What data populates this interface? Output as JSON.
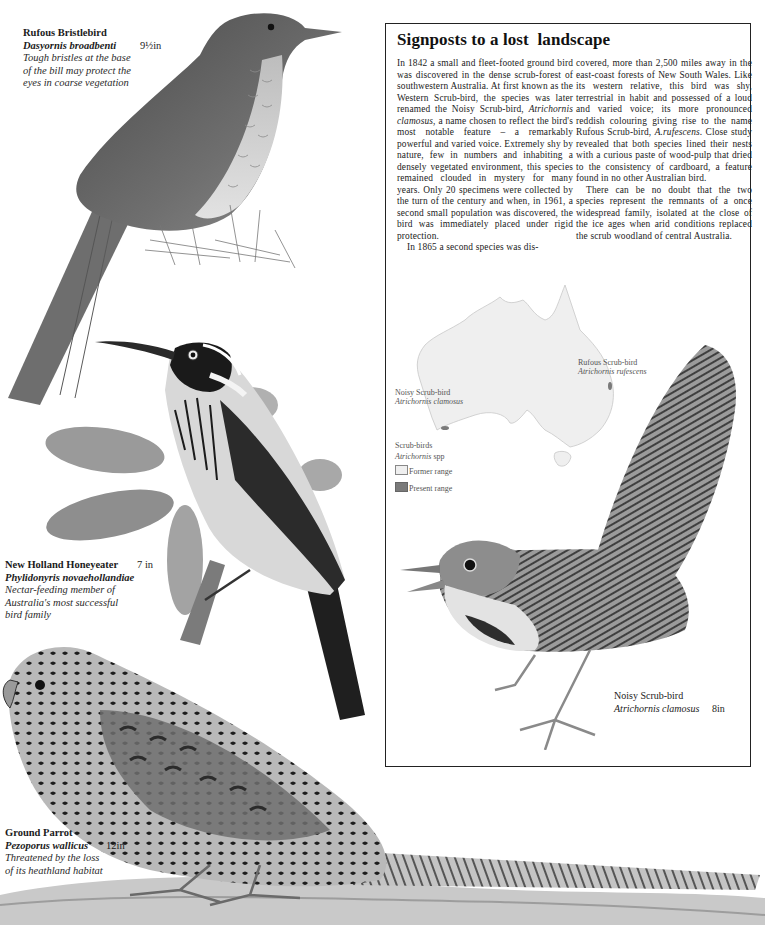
{
  "page": {
    "background": "#ffffff"
  },
  "species": {
    "rufous_bristlebird": {
      "common_name": "Rufous Bristlebird",
      "scientific_name": "Dasyornis broadbenti",
      "size": "9½in",
      "note_lines": [
        "Tough bristles at the base",
        "of the bill may protect the",
        "eyes in coarse vegetation"
      ]
    },
    "new_holland_honeyeater": {
      "common_name": "New Holland Honeyeater",
      "scientific_name": "Phylidonyris novaehollandiae",
      "size": "7 in",
      "note_lines": [
        "Nectar-feeding member of",
        "Australia's most successful",
        "bird family"
      ]
    },
    "noisy_scrub_bird": {
      "common_name": "Noisy Scrub-bird",
      "scientific_name": "Atrichornis clamosus",
      "size": "8in"
    },
    "ground_parrot": {
      "common_name": "Ground Parrot",
      "scientific_name": "Pezoporus wallicus",
      "size": "12in",
      "note_lines": [
        "Threatened by the loss",
        "of its heathland habitat"
      ]
    }
  },
  "feature_box": {
    "title": "Signposts to a lost  landscape",
    "column1": {
      "p1_a": "In 1842 a small and fleet-footed ground bird was discovered in the dense scrub-forest of southwestern Australia. At first known as the Western Scrub-bird, the species was later renamed the Noisy Scrub-bird, ",
      "p1_sci": "Atrichornis clamosus",
      "p1_b": ", a name chosen to reflect the bird's most notable feature – a remarkably powerful and varied voice. Extremely shy by nature, few in numbers and inhabiting a densely vegetated environment, this species remained clouded in mystery for many years. Only 20 specimens were collected by the turn of the century and when, in 1961, a second small population was discovered, the bird was immediately placed under rigid protection.",
      "p2": "In 1865 a second species was dis-"
    },
    "column2": {
      "p1_a": "covered, more than 2,500 miles away in the east-coast forests of New South Wales. Like its western relative, this bird was shy, terrestrial in habit and possessed of a loud and varied voice; its more pronounced reddish colouring giving rise to the name Rufous Scrub-bird, ",
      "p1_sci": "A.rufescens",
      "p1_b": ". Close study revealed that both species lined their nests with a curious paste of wood-pulp that dried to the consistency of cardboard, a feature found in no other Australian bird.",
      "p2": "There can be no doubt that the two species represent the remnants of a once widespread family, isolated at the close of the ice ages when arid conditions replaced the scrub woodland of central Australia."
    },
    "map": {
      "label_west_common": "Noisy Scrub-bird",
      "label_west_sci": "Atrichornis clamosus",
      "label_east_common": "Rufous Scrub-bird",
      "label_east_sci": "Atrichornis rufescens",
      "legend_title": "Scrub-birds",
      "legend_sci": "Atrichornis",
      "legend_sci_suffix": " spp",
      "legend_items": [
        {
          "label": "Former range",
          "color": "#efefef"
        },
        {
          "label": "Present range",
          "color": "#7a7a7a"
        }
      ]
    }
  }
}
